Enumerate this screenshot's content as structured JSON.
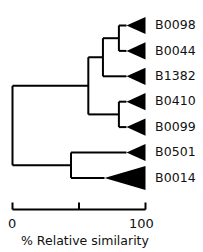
{
  "chart_data": {
    "type": "dendrogram",
    "title": "",
    "subtitle": "",
    "xlabel": "% Relative similarity",
    "ylabel": "",
    "xlim": [
      0,
      100
    ],
    "grid": false,
    "legend": null,
    "orientation": "left-to-right",
    "axis": {
      "tick_values": [
        0,
        50,
        100
      ],
      "tick_labels": [
        "0",
        "",
        "100"
      ],
      "tick_labels_shown": [
        "0",
        "100"
      ],
      "axis_title": "% Relative similarity",
      "axis_position": "bottom",
      "tick_direction": "up"
    },
    "leaf_marker": {
      "shape": "filled-triangle",
      "fill": "#000000",
      "apex": "left",
      "base": "right",
      "meaning": "collapsed clade"
    },
    "leaves": [
      {
        "label": "B0098",
        "row": 0,
        "similarity": 100,
        "wedge_span": "small"
      },
      {
        "label": "B0044",
        "row": 1,
        "similarity": 100,
        "wedge_span": "small"
      },
      {
        "label": "B1382",
        "row": 2,
        "similarity": 100,
        "wedge_span": "small"
      },
      {
        "label": "B0410",
        "row": 3,
        "similarity": 100,
        "wedge_span": "small"
      },
      {
        "label": "B0099",
        "row": 4,
        "similarity": 100,
        "wedge_span": "small"
      },
      {
        "label": "B0501",
        "row": 5,
        "similarity": 100,
        "wedge_span": "small"
      },
      {
        "label": "B0014",
        "row": 6,
        "similarity": 100,
        "wedge_span": "large"
      }
    ],
    "nodes": [
      {
        "id": "n-root",
        "similarity": 0,
        "children": [
          "n-upper",
          "n-lower"
        ]
      },
      {
        "id": "n-upper",
        "similarity": 57,
        "children": [
          "n-abc",
          "n-de"
        ]
      },
      {
        "id": "n-abc",
        "similarity": 68,
        "children": [
          "n-ab",
          "B1382"
        ]
      },
      {
        "id": "n-ab",
        "similarity": 80,
        "children": [
          "B0098",
          "B0044"
        ]
      },
      {
        "id": "n-de",
        "similarity": 80,
        "children": [
          "B0410",
          "B0099"
        ]
      },
      {
        "id": "n-lower",
        "similarity": 44,
        "children": [
          "B0501",
          "B0014"
        ]
      }
    ],
    "colors": {
      "line": "#000000",
      "leaf_fill": "#000000",
      "text": "#111111",
      "background": "#ffffff"
    }
  },
  "axis_labels": {
    "zero": "0",
    "hundred": "100",
    "title": "% Relative similarity"
  },
  "tips": {
    "t0": "B0098",
    "t1": "B0044",
    "t2": "B1382",
    "t3": "B0410",
    "t4": "B0099",
    "t5": "B0501",
    "t6": "B0014"
  }
}
